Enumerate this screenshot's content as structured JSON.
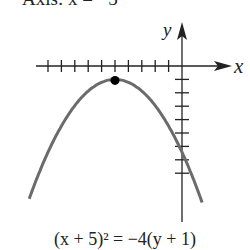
{
  "title": "Axis: x = −5",
  "axes": {
    "x_label": "x",
    "y_label": "y"
  },
  "equation": "(x + 5)² = −4(y + 1)",
  "chart_data": {
    "type": "line",
    "equation": "(x + 5)^2 = -4(y + 1)",
    "vertex": [
      -5,
      -1
    ],
    "xlabel": "x",
    "ylabel": "y",
    "x_ticks": [
      -10,
      -9,
      -8,
      -7,
      -6,
      -5,
      -4,
      -3,
      -2,
      -1
    ],
    "y_ticks": [
      -1,
      -2,
      -3,
      -4,
      -5,
      -6,
      -7,
      -8
    ],
    "origin_px": [
      182,
      66
    ],
    "unit_px": 13.4,
    "colors": {
      "curve": "#6b6b6b",
      "axes": "#222222",
      "vertex": "#000000"
    }
  }
}
